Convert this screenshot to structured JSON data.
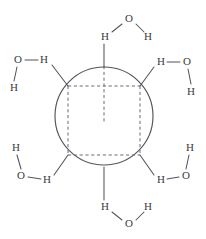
{
  "figure": {
    "colors": {
      "background": "#ffffff",
      "line": "#53535c",
      "dashed_line": "#6b6b75",
      "text": "#3a3a42"
    },
    "central_sphere": {
      "cx": 104,
      "cy": 116,
      "r": 49
    },
    "cube": {
      "front_top_left": {
        "x": 68,
        "y": 86
      },
      "front_top_right": {
        "x": 140,
        "y": 86
      },
      "front_bottom_left": {
        "x": 68,
        "y": 155
      },
      "front_bottom_right": {
        "x": 140,
        "y": 155
      },
      "axis_top": {
        "x": 104,
        "y": 66
      },
      "axis_bottom": {
        "x": 104,
        "y": 122
      }
    },
    "water_molecules": [
      {
        "id": "water-top",
        "position": "top",
        "atoms": [
          {
            "element": "O",
            "x": 129,
            "y": 19
          },
          {
            "element": "H",
            "x": 105,
            "y": 37
          },
          {
            "element": "H",
            "x": 148,
            "y": 37
          }
        ],
        "bond_to_core": {
          "from_x": 104,
          "from_y": 44,
          "to_x": 104,
          "to_y": 67
        }
      },
      {
        "id": "water-upper-left",
        "position": "upper-left",
        "atoms": [
          {
            "element": "O",
            "x": 18,
            "y": 60
          },
          {
            "element": "H",
            "x": 44,
            "y": 60
          },
          {
            "element": "H",
            "x": 14,
            "y": 88
          }
        ],
        "bond_to_core": {
          "from_x": 52,
          "from_y": 65,
          "to_x": 68,
          "to_y": 86
        }
      },
      {
        "id": "water-upper-right",
        "position": "upper-right",
        "atoms": [
          {
            "element": "H",
            "x": 161,
            "y": 62
          },
          {
            "element": "O",
            "x": 187,
            "y": 62
          },
          {
            "element": "H",
            "x": 191,
            "y": 92
          }
        ],
        "bond_to_core": {
          "from_x": 154,
          "from_y": 67,
          "to_x": 140,
          "to_y": 86
        }
      },
      {
        "id": "water-lower-left",
        "position": "lower-left",
        "atoms": [
          {
            "element": "H",
            "x": 16,
            "y": 148
          },
          {
            "element": "O",
            "x": 21,
            "y": 176
          },
          {
            "element": "H",
            "x": 47,
            "y": 180
          }
        ],
        "bond_to_core": {
          "from_x": 54,
          "from_y": 175,
          "to_x": 68,
          "to_y": 155
        }
      },
      {
        "id": "water-lower-right",
        "position": "lower-right",
        "atoms": [
          {
            "element": "H",
            "x": 190,
            "y": 148
          },
          {
            "element": "O",
            "x": 186,
            "y": 176
          },
          {
            "element": "H",
            "x": 161,
            "y": 180
          }
        ],
        "bond_to_core": {
          "from_x": 154,
          "from_y": 175,
          "to_x": 140,
          "to_y": 155
        }
      },
      {
        "id": "water-bottom",
        "position": "bottom",
        "atoms": [
          {
            "element": "H",
            "x": 105,
            "y": 207
          },
          {
            "element": "O",
            "x": 129,
            "y": 224
          },
          {
            "element": "H",
            "x": 148,
            "y": 207
          }
        ],
        "bond_to_core": {
          "from_x": 104,
          "from_y": 200,
          "to_x": 104,
          "to_y": 167
        }
      }
    ],
    "labels": {
      "oxygen": "O",
      "hydrogen": "H"
    }
  }
}
